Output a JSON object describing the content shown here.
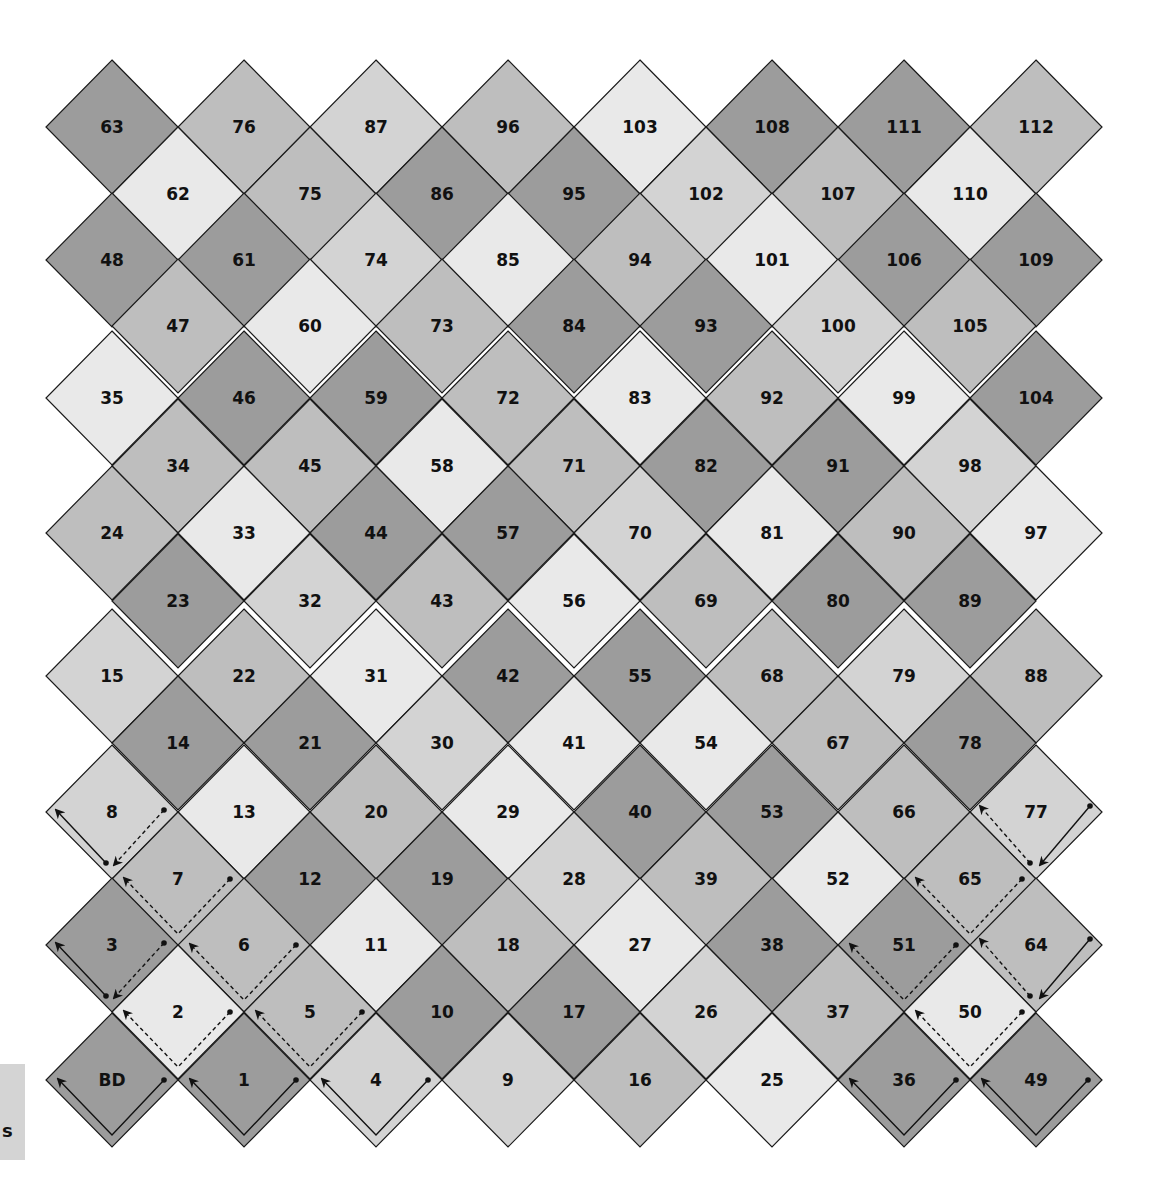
{
  "shades": {
    "D": "#9c9c9c",
    "M": "#bebebe",
    "LM": "#d3d3d3",
    "L": "#e9e9e9"
  },
  "grid": {
    "outer_x": [
      112,
      244,
      376,
      508,
      640,
      772,
      904,
      1036
    ],
    "inner_x": [
      178,
      310,
      442,
      574,
      706,
      838,
      970
    ],
    "half_w": 66,
    "half_h": 67,
    "rows": [
      {
        "y": 127,
        "type": "outer",
        "cells": [
          [
            "63",
            "D"
          ],
          [
            "76",
            "M"
          ],
          [
            "87",
            "LM"
          ],
          [
            "96",
            "M"
          ],
          [
            "103",
            "L"
          ],
          [
            "108",
            "D"
          ],
          [
            "111",
            "D"
          ],
          [
            "112",
            "M"
          ]
        ]
      },
      {
        "y": 194,
        "type": "inner",
        "cells": [
          [
            "62",
            "L"
          ],
          [
            "75",
            "M"
          ],
          [
            "86",
            "D"
          ],
          [
            "95",
            "D"
          ],
          [
            "102",
            "LM"
          ],
          [
            "107",
            "M"
          ],
          [
            "110",
            "L"
          ]
        ]
      },
      {
        "y": 260,
        "type": "outer",
        "cells": [
          [
            "48",
            "D"
          ],
          [
            "61",
            "D"
          ],
          [
            "74",
            "LM"
          ],
          [
            "85",
            "L"
          ],
          [
            "94",
            "M"
          ],
          [
            "101",
            "L"
          ],
          [
            "106",
            "D"
          ],
          [
            "109",
            "D"
          ]
        ]
      },
      {
        "y": 326,
        "type": "inner",
        "cells": [
          [
            "47",
            "M"
          ],
          [
            "60",
            "L"
          ],
          [
            "73",
            "M"
          ],
          [
            "84",
            "D"
          ],
          [
            "93",
            "D"
          ],
          [
            "100",
            "LM"
          ],
          [
            "105",
            "M"
          ]
        ]
      },
      {
        "y": 398,
        "type": "outer",
        "cells": [
          [
            "35",
            "L"
          ],
          [
            "46",
            "D"
          ],
          [
            "59",
            "D"
          ],
          [
            "72",
            "M"
          ],
          [
            "83",
            "L"
          ],
          [
            "92",
            "M"
          ],
          [
            "99",
            "L"
          ],
          [
            "104",
            "D"
          ]
        ]
      },
      {
        "y": 466,
        "type": "inner",
        "cells": [
          [
            "34",
            "M"
          ],
          [
            "45",
            "M"
          ],
          [
            "58",
            "L"
          ],
          [
            "71",
            "M"
          ],
          [
            "82",
            "D"
          ],
          [
            "91",
            "D"
          ],
          [
            "98",
            "LM"
          ]
        ]
      },
      {
        "y": 533,
        "type": "outer",
        "cells": [
          [
            "24",
            "M"
          ],
          [
            "33",
            "L"
          ],
          [
            "44",
            "D"
          ],
          [
            "57",
            "D"
          ],
          [
            "70",
            "LM"
          ],
          [
            "81",
            "L"
          ],
          [
            "90",
            "M"
          ],
          [
            "97",
            "L"
          ]
        ]
      },
      {
        "y": 601,
        "type": "inner",
        "cells": [
          [
            "23",
            "D"
          ],
          [
            "32",
            "LM"
          ],
          [
            "43",
            "M"
          ],
          [
            "56",
            "L"
          ],
          [
            "69",
            "M"
          ],
          [
            "80",
            "D"
          ],
          [
            "89",
            "D"
          ]
        ]
      },
      {
        "y": 676,
        "type": "outer",
        "cells": [
          [
            "15",
            "LM"
          ],
          [
            "22",
            "M"
          ],
          [
            "31",
            "L"
          ],
          [
            "42",
            "D"
          ],
          [
            "55",
            "D"
          ],
          [
            "68",
            "M"
          ],
          [
            "79",
            "LM"
          ],
          [
            "88",
            "M"
          ]
        ]
      },
      {
        "y": 743,
        "type": "inner",
        "cells": [
          [
            "14",
            "D"
          ],
          [
            "21",
            "D"
          ],
          [
            "30",
            "LM"
          ],
          [
            "41",
            "L"
          ],
          [
            "54",
            "L"
          ],
          [
            "67",
            "M"
          ],
          [
            "78",
            "D"
          ]
        ]
      },
      {
        "y": 812,
        "type": "outer",
        "cells": [
          [
            "8",
            "LM"
          ],
          [
            "13",
            "L"
          ],
          [
            "20",
            "M"
          ],
          [
            "29",
            "L"
          ],
          [
            "40",
            "D"
          ],
          [
            "53",
            "D"
          ],
          [
            "66",
            "M"
          ],
          [
            "77",
            "LM"
          ]
        ]
      },
      {
        "y": 879,
        "type": "inner",
        "cells": [
          [
            "7",
            "M"
          ],
          [
            "12",
            "D"
          ],
          [
            "19",
            "D"
          ],
          [
            "28",
            "LM"
          ],
          [
            "39",
            "M"
          ],
          [
            "52",
            "L"
          ],
          [
            "65",
            "M"
          ]
        ]
      },
      {
        "y": 945,
        "type": "outer",
        "cells": [
          [
            "3",
            "D"
          ],
          [
            "6",
            "M"
          ],
          [
            "11",
            "L"
          ],
          [
            "18",
            "M"
          ],
          [
            "27",
            "L"
          ],
          [
            "38",
            "D"
          ],
          [
            "51",
            "D"
          ],
          [
            "64",
            "M"
          ]
        ]
      },
      {
        "y": 1012,
        "type": "inner",
        "cells": [
          [
            "2",
            "L"
          ],
          [
            "5",
            "M"
          ],
          [
            "10",
            "D"
          ],
          [
            "17",
            "D"
          ],
          [
            "26",
            "LM"
          ],
          [
            "37",
            "M"
          ],
          [
            "50",
            "L"
          ]
        ]
      },
      {
        "y": 1080,
        "type": "outer",
        "cells": [
          [
            "BD",
            "D"
          ],
          [
            "1",
            "D"
          ],
          [
            "4",
            "LM"
          ],
          [
            "9",
            "LM"
          ],
          [
            "16",
            "M"
          ],
          [
            "25",
            "L"
          ],
          [
            "36",
            "D"
          ],
          [
            "49",
            "D"
          ]
        ]
      }
    ]
  },
  "paths": [
    {
      "cell": "BD",
      "style": "solid",
      "kind": "down-left-up"
    },
    {
      "cell": "1",
      "style": "solid",
      "kind": "down-left-up"
    },
    {
      "cell": "4",
      "style": "solid",
      "kind": "down-left-up"
    },
    {
      "cell": "36",
      "style": "solid",
      "kind": "down-left-up"
    },
    {
      "cell": "49",
      "style": "solid",
      "kind": "down-left-up"
    },
    {
      "cell": "2",
      "style": "dashed",
      "kind": "down-left-up"
    },
    {
      "cell": "5",
      "style": "dashed",
      "kind": "down-left-up"
    },
    {
      "cell": "6",
      "style": "dashed",
      "kind": "down-left-up"
    },
    {
      "cell": "7",
      "style": "dashed",
      "kind": "down-left-up"
    },
    {
      "cell": "50",
      "style": "dashed",
      "kind": "down-left-up"
    },
    {
      "cell": "51",
      "style": "dashed",
      "kind": "down-left-up"
    },
    {
      "cell": "65",
      "style": "dashed",
      "kind": "down-left-up"
    },
    {
      "cell": "3",
      "style": "split-left",
      "kind": "left-solid-right-dashed"
    },
    {
      "cell": "8",
      "style": "split-left",
      "kind": "left-solid-right-dashed"
    },
    {
      "cell": "64",
      "style": "split-right",
      "kind": "right-solid-left-dashed"
    },
    {
      "cell": "77",
      "style": "split-right",
      "kind": "right-solid-left-dashed"
    }
  ],
  "legend": {
    "text": "s"
  }
}
